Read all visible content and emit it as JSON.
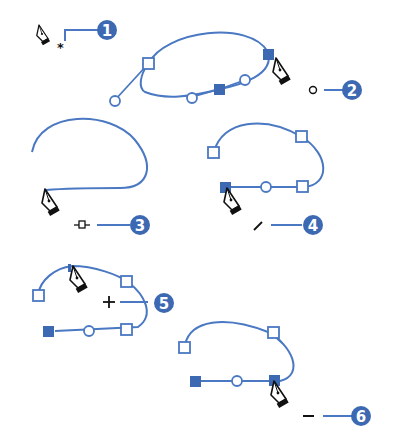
{
  "diagram": {
    "colors": {
      "path": "#4a78c2",
      "badge": "#3d69b3",
      "cursor": "#111111"
    },
    "callouts": [
      {
        "number": "1",
        "cursor_modifier": "asterisk",
        "glyph": "*",
        "meaning": "start new path"
      },
      {
        "number": "2",
        "cursor_modifier": "circle",
        "glyph": "○",
        "meaning": "close path"
      },
      {
        "number": "3",
        "cursor_modifier": "join",
        "glyph": "-□-",
        "meaning": "connect to path"
      },
      {
        "number": "4",
        "cursor_modifier": "slash",
        "glyph": "/",
        "meaning": "continue path"
      },
      {
        "number": "5",
        "cursor_modifier": "plus",
        "glyph": "+",
        "meaning": "add anchor point"
      },
      {
        "number": "6",
        "cursor_modifier": "minus",
        "glyph": "−",
        "meaning": "delete anchor point"
      }
    ]
  }
}
